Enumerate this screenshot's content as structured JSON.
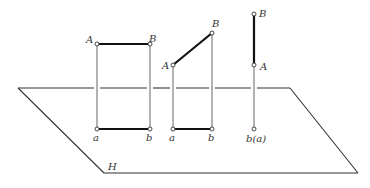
{
  "plane": {
    "label": "H",
    "corners": [
      [
        18,
        88
      ],
      [
        290,
        88
      ],
      [
        358,
        173
      ],
      [
        104,
        173
      ]
    ]
  },
  "figures": [
    {
      "name": "segment-parallel-to-H",
      "A": {
        "label": "A",
        "x": 97,
        "y": 44
      },
      "B": {
        "label": "B",
        "x": 150,
        "y": 44
      },
      "a": {
        "label": "a",
        "x": 97,
        "y": 129
      },
      "b": {
        "label": "b",
        "x": 150,
        "y": 129
      }
    },
    {
      "name": "segment-oblique",
      "A": {
        "label": "A",
        "x": 173,
        "y": 65
      },
      "B": {
        "label": "B",
        "x": 212,
        "y": 33
      },
      "a": {
        "label": "a",
        "x": 173,
        "y": 129
      },
      "b": {
        "label": "b",
        "x": 212,
        "y": 129
      }
    },
    {
      "name": "segment-perpendicular-to-H",
      "B": {
        "label": "B",
        "x": 254,
        "y": 14
      },
      "A": {
        "label": "A",
        "x": 254,
        "y": 65
      },
      "ba": {
        "label": "b(a)",
        "x": 254,
        "y": 129
      }
    }
  ],
  "colors": {
    "line": "#333333",
    "segment": "#111111",
    "background": "#ffffff"
  }
}
